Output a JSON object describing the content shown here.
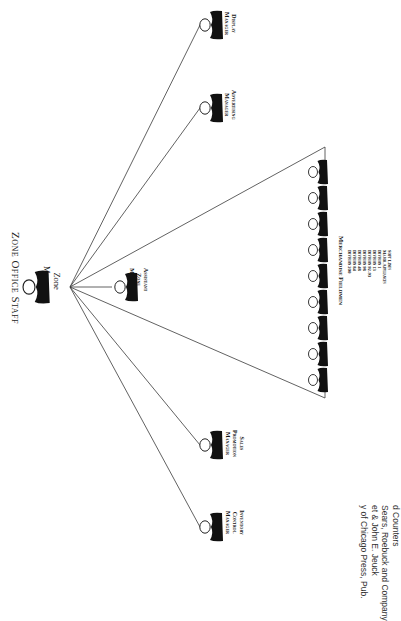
{
  "title": "Zone Office Staff",
  "zone_manager": {
    "line1": "Zone",
    "line2": "Manager"
  },
  "assistant_zone_manager": {
    "line1": "Assistant",
    "line2": "Zone",
    "line3": "Manager"
  },
  "staff": [
    {
      "id": "display",
      "line1": "Display",
      "line2": "Manager"
    },
    {
      "id": "advertising",
      "line1": "Advertising",
      "line2": "Manager"
    },
    {
      "id": "sales-promotion",
      "line1": "Sales",
      "line2": "Promotion",
      "line3": "Manager"
    },
    {
      "id": "inventory-control",
      "line1": "Inventory",
      "line2": "Control",
      "line3": "Manager"
    }
  ],
  "merchandise_fieldmen": {
    "title": "Merchandise Fieldmen",
    "count": 9,
    "divisions": [
      "Soft Lines",
      "Major Appliances",
      "Division 1",
      "Division 13",
      "Division 92-93",
      "Division 98",
      "Division 48",
      "Division 84",
      "Division 200"
    ]
  },
  "caption": {
    "line1": "d Counters",
    "line2": "Sears, Roebuck and Company",
    "line3": "et & John E. Jeuck",
    "line4": "y of Chicago Press, Pub."
  },
  "colors": {
    "ink": "#111111",
    "line": "#3a3a3a",
    "background": "#ffffff"
  }
}
